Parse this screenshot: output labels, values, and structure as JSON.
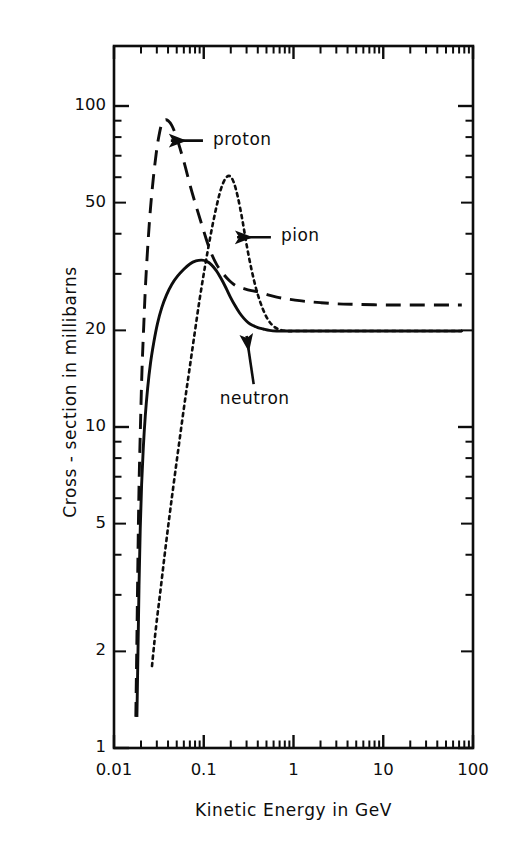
{
  "chart_data": {
    "type": "line",
    "title": "",
    "xlabel": "Kinetic Energy in  GeV",
    "ylabel": "Cross - section  in  millibarns",
    "xscale": "log",
    "yscale": "log",
    "xlim": [
      0.01,
      100
    ],
    "ylim": [
      1,
      160
    ],
    "grid": false,
    "legend_position": "inline-arrow-annotations",
    "xticks": [
      {
        "value": 0.01,
        "label": "0.01"
      },
      {
        "value": 0.1,
        "label": "0.1"
      },
      {
        "value": 1,
        "label": "1"
      },
      {
        "value": 10,
        "label": "10"
      },
      {
        "value": 100,
        "label": "100"
      }
    ],
    "yticks": [
      {
        "value": 1,
        "label": "1"
      },
      {
        "value": 2,
        "label": "2"
      },
      {
        "value": 5,
        "label": "5"
      },
      {
        "value": 10,
        "label": "10"
      },
      {
        "value": 20,
        "label": "20"
      },
      {
        "value": 50,
        "label": "50"
      },
      {
        "value": 100,
        "label": "100"
      }
    ],
    "series": [
      {
        "name": "proton",
        "label": "proton",
        "style": "long-dashed",
        "color": "#0d0d0d",
        "peak": {
          "x": 0.035,
          "y": 90
        },
        "asymptote_y": 24,
        "points": [
          [
            0.0175,
            1.25
          ],
          [
            0.018,
            2.2
          ],
          [
            0.0185,
            4.0
          ],
          [
            0.019,
            6.5
          ],
          [
            0.0197,
            10.0
          ],
          [
            0.0205,
            15.0
          ],
          [
            0.0215,
            21.0
          ],
          [
            0.0225,
            28.0
          ],
          [
            0.024,
            38.0
          ],
          [
            0.0255,
            48.0
          ],
          [
            0.0275,
            60.0
          ],
          [
            0.0295,
            71.0
          ],
          [
            0.0315,
            80.0
          ],
          [
            0.034,
            88.0
          ],
          [
            0.037,
            90.5
          ],
          [
            0.04,
            90.0
          ],
          [
            0.044,
            87.0
          ],
          [
            0.049,
            81.0
          ],
          [
            0.055,
            73.0
          ],
          [
            0.062,
            65.0
          ],
          [
            0.07,
            57.0
          ],
          [
            0.08,
            50.0
          ],
          [
            0.092,
            44.0
          ],
          [
            0.105,
            39.0
          ],
          [
            0.12,
            35.0
          ],
          [
            0.14,
            32.0
          ],
          [
            0.165,
            30.0
          ],
          [
            0.195,
            28.5
          ],
          [
            0.23,
            27.5
          ],
          [
            0.28,
            27.0
          ],
          [
            0.34,
            26.6
          ],
          [
            0.42,
            26.3
          ],
          [
            0.52,
            25.8
          ],
          [
            0.65,
            25.4
          ],
          [
            0.8,
            25.1
          ],
          [
            1.0,
            24.9
          ],
          [
            1.4,
            24.6
          ],
          [
            2.0,
            24.4
          ],
          [
            3.0,
            24.2
          ],
          [
            5.0,
            24.1
          ],
          [
            10.0,
            24.0
          ],
          [
            20.0,
            24.0
          ],
          [
            50.0,
            24.0
          ],
          [
            75.0,
            24.0
          ]
        ]
      },
      {
        "name": "pion",
        "label": "pion",
        "style": "dotted",
        "color": "#0d0d0d",
        "peak": {
          "x": 0.19,
          "y": 60
        },
        "asymptote_y": 20,
        "points": [
          [
            0.0265,
            1.8
          ],
          [
            0.028,
            2.1
          ],
          [
            0.03,
            2.5
          ],
          [
            0.0325,
            3.0
          ],
          [
            0.0355,
            3.7
          ],
          [
            0.039,
            4.6
          ],
          [
            0.043,
            5.7
          ],
          [
            0.048,
            7.2
          ],
          [
            0.054,
            9.2
          ],
          [
            0.061,
            11.8
          ],
          [
            0.069,
            15.0
          ],
          [
            0.079,
            19.5
          ],
          [
            0.09,
            25.0
          ],
          [
            0.103,
            31.5
          ],
          [
            0.118,
            39.0
          ],
          [
            0.135,
            47.0
          ],
          [
            0.155,
            55.0
          ],
          [
            0.175,
            59.5
          ],
          [
            0.195,
            60.5
          ],
          [
            0.215,
            58.0
          ],
          [
            0.24,
            52.0
          ],
          [
            0.27,
            44.0
          ],
          [
            0.3,
            37.0
          ],
          [
            0.34,
            31.0
          ],
          [
            0.39,
            26.5
          ],
          [
            0.45,
            23.5
          ],
          [
            0.52,
            21.6
          ],
          [
            0.6,
            20.6
          ],
          [
            0.7,
            20.1
          ],
          [
            0.85,
            19.9
          ],
          [
            1.0,
            19.9
          ],
          [
            1.5,
            19.9
          ],
          [
            2.5,
            19.9
          ],
          [
            5.0,
            19.9
          ],
          [
            10.0,
            19.9
          ],
          [
            30.0,
            19.9
          ],
          [
            75.0,
            19.9
          ]
        ]
      },
      {
        "name": "neutron",
        "label": "neutron",
        "style": "solid",
        "color": "#0d0d0d",
        "peak": {
          "x": 0.1,
          "y": 33
        },
        "asymptote_y": 20,
        "points": [
          [
            0.018,
            1.25
          ],
          [
            0.0185,
            2.0
          ],
          [
            0.019,
            3.2
          ],
          [
            0.0196,
            4.8
          ],
          [
            0.0203,
            6.6
          ],
          [
            0.0212,
            8.6
          ],
          [
            0.0223,
            10.8
          ],
          [
            0.0237,
            13.2
          ],
          [
            0.0255,
            15.8
          ],
          [
            0.0278,
            18.4
          ],
          [
            0.0305,
            21.0
          ],
          [
            0.034,
            23.5
          ],
          [
            0.0385,
            25.8
          ],
          [
            0.044,
            27.8
          ],
          [
            0.051,
            29.5
          ],
          [
            0.06,
            31.0
          ],
          [
            0.07,
            32.2
          ],
          [
            0.082,
            32.9
          ],
          [
            0.095,
            33.1
          ],
          [
            0.108,
            32.8
          ],
          [
            0.122,
            32.0
          ],
          [
            0.138,
            30.7
          ],
          [
            0.156,
            29.0
          ],
          [
            0.176,
            27.2
          ],
          [
            0.198,
            25.4
          ],
          [
            0.223,
            23.9
          ],
          [
            0.25,
            22.7
          ],
          [
            0.28,
            21.8
          ],
          [
            0.315,
            21.1
          ],
          [
            0.355,
            20.7
          ],
          [
            0.4,
            20.4
          ],
          [
            0.46,
            20.2
          ],
          [
            0.54,
            20.0
          ],
          [
            0.65,
            19.9
          ],
          [
            0.8,
            19.9
          ],
          [
            1.0,
            19.9
          ],
          [
            2.0,
            19.9
          ],
          [
            5.0,
            19.9
          ],
          [
            15.0,
            19.9
          ],
          [
            40.0,
            19.9
          ],
          [
            75.0,
            19.9
          ]
        ]
      }
    ],
    "annotations": [
      {
        "name": "proton",
        "text": "proton",
        "arrow_from": {
          "x": 0.098,
          "y": 78
        },
        "arrow_to": {
          "x": 0.043,
          "y": 78
        }
      },
      {
        "name": "pion",
        "text": "pion",
        "arrow_from": {
          "x": 0.56,
          "y": 39
        },
        "arrow_to": {
          "x": 0.235,
          "y": 39
        }
      },
      {
        "name": "neutron",
        "text": "neutron",
        "arrow_from": {
          "x": 0.36,
          "y": 13.6
        },
        "arrow_to": {
          "x": 0.3,
          "y": 19.2
        }
      }
    ]
  },
  "axes": {
    "x_title": "Kinetic Energy in  GeV",
    "y_title": "Cross - section  in  millibarns",
    "x_tick_labels": [
      "0.01",
      "0.1",
      "1",
      "10",
      "100"
    ],
    "y_tick_labels": [
      "100",
      "50",
      "20",
      "10",
      "5",
      "2",
      "1"
    ]
  },
  "labels": {
    "proton": "proton",
    "pion": "pion",
    "neutron": "neutron"
  },
  "colors": {
    "ink": "#0d0d0d",
    "background": "#ffffff"
  }
}
